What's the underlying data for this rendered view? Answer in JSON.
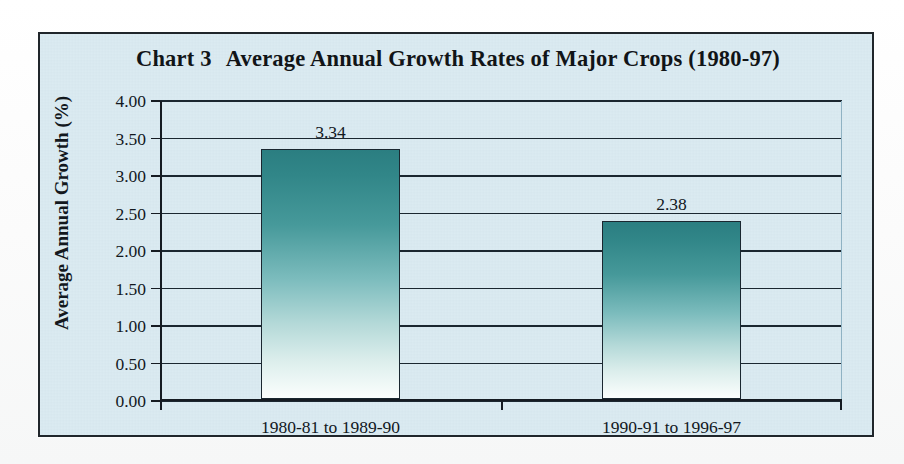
{
  "figure": {
    "title_prefix": "Chart 3",
    "title_text": "Average Annual Growth Rates of Major Crops (1980-97)",
    "frame_color": "#20262b",
    "background_color": "#d9e9f0"
  },
  "chart_data": {
    "type": "bar",
    "xlabel": "",
    "ylabel": "Average Annual Growth (%)",
    "categories": [
      "1980-81 to 1989-90",
      "1990-91 to 1996-97"
    ],
    "values": [
      3.34,
      2.38
    ],
    "value_labels": [
      "3.34",
      "2.38"
    ],
    "ylim": [
      0.0,
      4.0
    ],
    "ytick_values": [
      0.0,
      0.5,
      1.0,
      1.5,
      2.0,
      2.5,
      3.0,
      3.5,
      4.0
    ],
    "ytick_labels": [
      "0.00",
      "0.50",
      "1.00",
      "1.50",
      "2.00",
      "2.50",
      "3.00",
      "3.50",
      "4.00"
    ],
    "grid": true,
    "legend": null,
    "series": [
      {
        "name": "Average Annual Growth",
        "values": [
          3.34,
          2.38
        ]
      }
    ],
    "bar_fill_top_color": "#2b7e81",
    "bar_fill_bottom_color": "#fbfefd",
    "bar_edge_color": "#1a2730",
    "gridline_color": "#1b2730"
  }
}
